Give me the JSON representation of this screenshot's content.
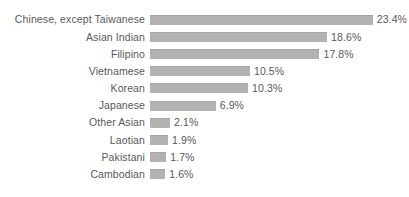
{
  "chart_data": {
    "type": "bar",
    "orientation": "horizontal",
    "title": "",
    "subtitle": "",
    "xlabel": "",
    "ylabel": "",
    "grid": false,
    "legend": "none",
    "xlim": [
      0,
      23.4
    ],
    "value_suffix": "%",
    "categories": [
      "Chinese, except Taiwanese",
      "Asian Indian",
      "Filipino",
      "Vietnamese",
      "Korean",
      "Japanese",
      "Other Asian",
      "Laotian",
      "Pakistani",
      "Cambodian"
    ],
    "values": [
      23.4,
      18.6,
      17.8,
      10.5,
      10.3,
      6.9,
      2.1,
      1.9,
      1.7,
      1.6
    ],
    "value_labels": [
      "23.4%",
      "18.6%",
      "17.8%",
      "10.5%",
      "10.3%",
      "6.9%",
      "2.1%",
      "1.9%",
      "1.7%",
      "1.6%"
    ],
    "colors": {
      "bar": "#b2b2b2",
      "bar_edge": "#a6a6a6",
      "text": "#58585a",
      "background": "#ffffff"
    },
    "px_per_unit": 9.52
  }
}
